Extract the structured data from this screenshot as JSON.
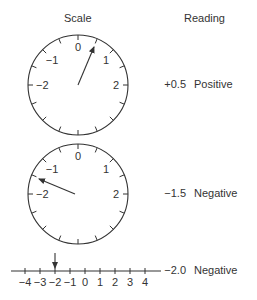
{
  "headers": {
    "scale": "Scale",
    "reading": "Reading"
  },
  "dials": [
    {
      "labels": {
        "0": "0",
        "1": "1",
        "2": "2",
        "-1": "−1",
        "-2": "−2"
      },
      "pointer_value": 0.5,
      "reading_value": "+0.5",
      "reading_sign": "Positive"
    },
    {
      "labels": {
        "0": "0",
        "1": "1",
        "2": "2",
        "-1": "−1",
        "-2": "−2"
      },
      "pointer_value": -1.5,
      "reading_value": "−1.5",
      "reading_sign": "Negative"
    }
  ],
  "number_line": {
    "ticks": [
      "−4",
      "−3",
      "−2",
      "−1",
      "0",
      "1",
      "2",
      "3",
      "4"
    ],
    "pointer_value": -2.0,
    "reading_value": "−2.0",
    "reading_sign": "Negative"
  },
  "colors": {
    "stroke": "#333333",
    "text": "#333333"
  }
}
